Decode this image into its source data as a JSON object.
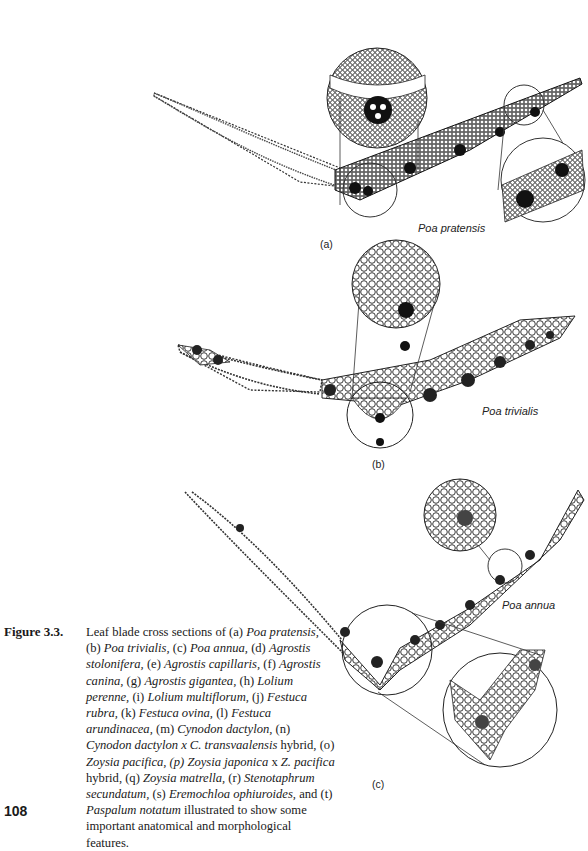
{
  "figure": {
    "number_label": "Figure 3.3.",
    "caption_segments": [
      {
        "t": "Leaf blade cross sections of (a) ",
        "i": false
      },
      {
        "t": "Poa pratensis,",
        "i": true
      },
      {
        "t": " (b) ",
        "i": false
      },
      {
        "t": "Poa trivialis,",
        "i": true
      },
      {
        "t": " (c) ",
        "i": false
      },
      {
        "t": "Poa annua,",
        "i": true
      },
      {
        "t": " (d) ",
        "i": false
      },
      {
        "t": "Agrostis stolonifera,",
        "i": true
      },
      {
        "t": " (e) ",
        "i": false
      },
      {
        "t": "Agrostis capillaris,",
        "i": true
      },
      {
        "t": " (f) ",
        "i": false
      },
      {
        "t": "Agrostis canina,",
        "i": true
      },
      {
        "t": " (g) ",
        "i": false
      },
      {
        "t": "Agrostis gigantea,",
        "i": true
      },
      {
        "t": " (h) ",
        "i": false
      },
      {
        "t": "Lolium perenne,",
        "i": true
      },
      {
        "t": " (i) ",
        "i": false
      },
      {
        "t": "Lolium multiflorum,",
        "i": true
      },
      {
        "t": " (j) ",
        "i": false
      },
      {
        "t": "Festuca rubra,",
        "i": true
      },
      {
        "t": " (k) ",
        "i": false
      },
      {
        "t": "Festuca ovina,",
        "i": true
      },
      {
        "t": " (l) ",
        "i": false
      },
      {
        "t": "Festuca arundinacea,",
        "i": true
      },
      {
        "t": " (m) ",
        "i": false
      },
      {
        "t": "Cynodon dactylon,",
        "i": true
      },
      {
        "t": " (n) ",
        "i": false
      },
      {
        "t": "Cynodon dactylon x C. transvaalensis",
        "i": true
      },
      {
        "t": " hybrid, (o) ",
        "i": false
      },
      {
        "t": "Zoysia pacifica, (p) Zoysia japonica",
        "i": true
      },
      {
        "t": " x ",
        "i": false
      },
      {
        "t": "Z. pacifica",
        "i": true
      },
      {
        "t": " hybrid, (q) ",
        "i": false
      },
      {
        "t": "Zoysia matrella,",
        "i": true
      },
      {
        "t": " (r) ",
        "i": false
      },
      {
        "t": "Stenotaphrum secundatum,",
        "i": true
      },
      {
        "t": " (s) ",
        "i": false
      },
      {
        "t": "Eremochloa ophiuroides,",
        "i": true
      },
      {
        "t": " and (t) ",
        "i": false
      },
      {
        "t": "Paspalum notatum",
        "i": true
      },
      {
        "t": " illustrated to show some important anatomical and morphological features.",
        "i": false
      }
    ],
    "panels": [
      {
        "id": "a",
        "label": "(a)",
        "species": "Poa pratensis"
      },
      {
        "id": "b",
        "label": "(b)",
        "species": "Poa trivialis"
      },
      {
        "id": "c",
        "label": "(c)",
        "species": "Poa annua"
      }
    ]
  },
  "page": {
    "number": "108"
  }
}
